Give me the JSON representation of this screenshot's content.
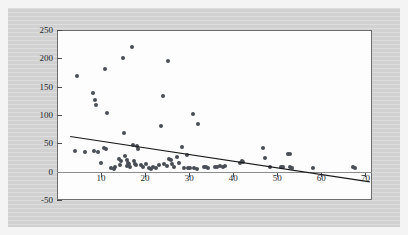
{
  "figure": {
    "background_color": "#d4d4d4",
    "plot_background_color": "#fdfdfd",
    "axis_color": "#6e6e6e",
    "point_color": "#494d55",
    "trend_line_color": "#1a1a1a"
  },
  "chart_data": {
    "type": "scatter",
    "title": "",
    "xlabel": "",
    "ylabel": "",
    "xlim": [
      0,
      71.5
    ],
    "ylim": [
      -50,
      250
    ],
    "grid": false,
    "legend": null,
    "xticks": [
      10,
      20,
      30,
      40,
      50,
      60,
      70
    ],
    "yticks": [
      -50,
      0,
      50,
      100,
      150,
      100,
      200,
      250
    ],
    "ytick_labels": [
      "250",
      "200",
      "150",
      "100",
      "50",
      "0",
      "-50"
    ],
    "xtick_labels": [
      "10",
      "20",
      "30",
      "40",
      "50",
      "60",
      "70"
    ],
    "points": [
      [
        4.6,
        168
      ],
      [
        4.0,
        37
      ],
      [
        6.3,
        35
      ],
      [
        8.2,
        139
      ],
      [
        8.6,
        127
      ],
      [
        8.9,
        117
      ],
      [
        8.4,
        36
      ],
      [
        9.4,
        34
      ],
      [
        10.1,
        15
      ],
      [
        10.8,
        182
      ],
      [
        11.3,
        104
      ],
      [
        10.6,
        41
      ],
      [
        11.2,
        40
      ],
      [
        12.3,
        7
      ],
      [
        13.2,
        9
      ],
      [
        13.0,
        5
      ],
      [
        14.0,
        23
      ],
      [
        14.6,
        19
      ],
      [
        14.2,
        12
      ],
      [
        15.0,
        200
      ],
      [
        15.3,
        68
      ],
      [
        15.5,
        27
      ],
      [
        15.8,
        20
      ],
      [
        16.1,
        16
      ],
      [
        16.4,
        14
      ],
      [
        15.9,
        10
      ],
      [
        16.6,
        8
      ],
      [
        17.0,
        220
      ],
      [
        17.2,
        47
      ],
      [
        17.4,
        18
      ],
      [
        17.8,
        13
      ],
      [
        18.2,
        45
      ],
      [
        18.4,
        40
      ],
      [
        18.0,
        12
      ],
      [
        19.1,
        11
      ],
      [
        19.6,
        9
      ],
      [
        20.3,
        13
      ],
      [
        20.8,
        6
      ],
      [
        21.3,
        5
      ],
      [
        21.8,
        8
      ],
      [
        22.4,
        6
      ],
      [
        23.2,
        11
      ],
      [
        23.6,
        80
      ],
      [
        24.1,
        133
      ],
      [
        24.4,
        13
      ],
      [
        24.9,
        10
      ],
      [
        25.2,
        196
      ],
      [
        25.4,
        22
      ],
      [
        25.8,
        20
      ],
      [
        26.1,
        13
      ],
      [
        26.5,
        9
      ],
      [
        27.3,
        26
      ],
      [
        27.8,
        15
      ],
      [
        28.4,
        44
      ],
      [
        28.9,
        7
      ],
      [
        29.4,
        30
      ],
      [
        29.8,
        6
      ],
      [
        30.3,
        7
      ],
      [
        30.8,
        102
      ],
      [
        31.2,
        6
      ],
      [
        31.7,
        5
      ],
      [
        32.1,
        84
      ],
      [
        33.4,
        8
      ],
      [
        33.9,
        9
      ],
      [
        34.3,
        7
      ],
      [
        35.8,
        9
      ],
      [
        36.4,
        8
      ],
      [
        37.1,
        10
      ],
      [
        37.6,
        9
      ],
      [
        38.2,
        10
      ],
      [
        41.6,
        16
      ],
      [
        41.9,
        18
      ],
      [
        42.2,
        17
      ],
      [
        46.8,
        41
      ],
      [
        47.2,
        24
      ],
      [
        48.3,
        9
      ],
      [
        50.8,
        8
      ],
      [
        51.3,
        9
      ],
      [
        52.5,
        31
      ],
      [
        53.0,
        32
      ],
      [
        52.8,
        8
      ],
      [
        53.4,
        7
      ],
      [
        58.1,
        6
      ],
      [
        67.3,
        8
      ],
      [
        67.6,
        7
      ]
    ],
    "trend_line": {
      "x0": 3.0,
      "y0": 62,
      "x1": 71.0,
      "y1": -18,
      "description": "negative linear fit overlay"
    }
  }
}
